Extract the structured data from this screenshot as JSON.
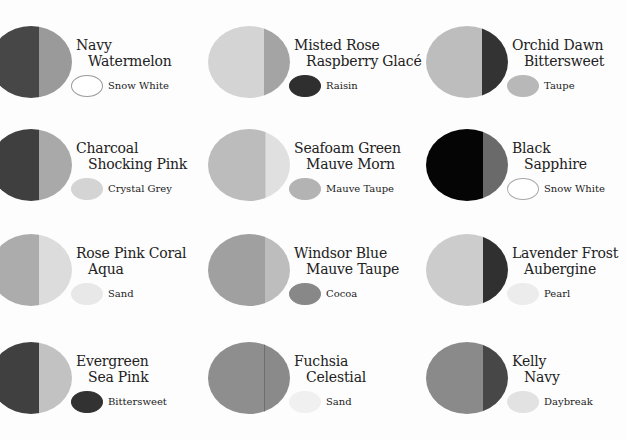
{
  "swatches": [
    {
      "primary": "Navy",
      "secondary": "Watermelon",
      "accent": "Snow White",
      "left_color": "#474747",
      "right_color": "#9a9a9a",
      "accent_color": "#ffffff",
      "accent_border": "#9a9a9a",
      "split": 0.6
    },
    {
      "primary": "Misted Rose",
      "secondary": "Raspberry Glacé",
      "accent": "Raisin",
      "left_color": "#d4d4d4",
      "right_color": "#a4a4a4",
      "accent_color": "#2f2f2f",
      "accent_border": "#2f2f2f",
      "split": 0.68
    },
    {
      "primary": "Orchid Dawn",
      "secondary": "Bittersweet",
      "accent": "Taupe",
      "left_color": "#bdbdbd",
      "right_color": "#333333",
      "accent_color": "#b8b8b8",
      "accent_border": "#b8b8b8",
      "split": 0.68
    },
    {
      "primary": "Charcoal",
      "secondary": "Shocking Pink",
      "accent": "Crystal Grey",
      "left_color": "#3f3f3f",
      "right_color": "#a9a9a9",
      "accent_color": "#d4d4d4",
      "accent_border": "#d4d4d4",
      "split": 0.6
    },
    {
      "primary": "Seafoam Green",
      "secondary": "Mauve Morn",
      "accent": "Mauve Taupe",
      "left_color": "#bcbcbc",
      "right_color": "#e0e0e0",
      "accent_color": "#b3b3b3",
      "accent_border": "#b3b3b3",
      "split": 0.7
    },
    {
      "primary": "Black",
      "secondary": "Sapphire",
      "accent": "Snow White",
      "left_color": "#050505",
      "right_color": "#6a6a6a",
      "accent_color": "#ffffff",
      "accent_border": "#a8a8a8",
      "split": 0.7
    },
    {
      "primary": "Rose Pink Coral",
      "secondary": "Aqua",
      "accent": "Sand",
      "left_color": "#acacac",
      "right_color": "#dcdcdc",
      "accent_color": "#e8e8e8",
      "accent_border": "#e8e8e8",
      "split": 0.6
    },
    {
      "primary": "Windsor Blue",
      "secondary": "Mauve Taupe",
      "accent": "Cocoa",
      "left_color": "#a0a0a0",
      "right_color": "#bdbdbd",
      "accent_color": "#888888",
      "accent_border": "#888888",
      "split": 0.7
    },
    {
      "primary": "Lavender Frost",
      "secondary": "Aubergine",
      "accent": "Pearl",
      "left_color": "#cccccc",
      "right_color": "#303030",
      "accent_color": "#ececec",
      "accent_border": "#ececec",
      "split": 0.7
    },
    {
      "primary": "Evergreen",
      "secondary": "Sea Pink",
      "accent": "Bittersweet",
      "left_color": "#404040",
      "right_color": "#c2c2c2",
      "accent_color": "#323232",
      "accent_border": "#323232",
      "split": 0.6
    },
    {
      "primary": "Fuchsia",
      "secondary": "Celestial",
      "accent": "Sand",
      "left_color": "#8e8e8e",
      "right_color": "#8a8a8a",
      "accent_color": "#f0f0f0",
      "accent_border": "#f0f0f0",
      "split": 0.68
    },
    {
      "primary": "Kelly",
      "secondary": "Navy",
      "accent": "Daybreak",
      "left_color": "#8a8a8a",
      "right_color": "#474747",
      "accent_color": "#e2e2e2",
      "accent_border": "#e2e2e2",
      "split": 0.7
    }
  ]
}
